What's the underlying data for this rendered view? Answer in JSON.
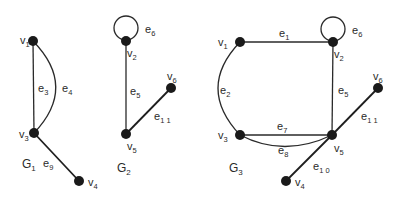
{
  "diagram": {
    "colors": {
      "background": "#ffffff",
      "ink": "#1a1a1a"
    },
    "graphs": [
      {
        "name": "G",
        "sub": "1",
        "label_pos": [
          22,
          168
        ],
        "nodes": [
          {
            "id": "v1",
            "name": "v",
            "sub": "1",
            "x": 33,
            "y": 41,
            "lx": 20,
            "ly": 44
          },
          {
            "id": "v3",
            "name": "v",
            "sub": "3",
            "x": 34,
            "y": 133,
            "lx": 19,
            "ly": 138
          },
          {
            "id": "v4",
            "name": "v",
            "sub": "4",
            "x": 79,
            "y": 181,
            "lx": 88,
            "ly": 186
          }
        ],
        "edges": [
          {
            "id": "e3",
            "name": "e",
            "sub": "3",
            "from": "v1",
            "to": "v3",
            "type": "line",
            "lx": 38,
            "ly": 92
          },
          {
            "id": "e4",
            "name": "e",
            "sub": "4",
            "from": "v1",
            "to": "v3",
            "type": "arc",
            "ctrl": [
              78,
              87
            ],
            "lx": 62,
            "ly": 92
          },
          {
            "id": "e9",
            "name": "e",
            "sub": "9",
            "from": "v3",
            "to": "v4",
            "type": "line",
            "lx": 43,
            "ly": 167
          }
        ]
      },
      {
        "name": "G",
        "sub": "2",
        "label_pos": [
          117,
          172
        ],
        "nodes": [
          {
            "id": "v2",
            "name": "v",
            "sub": "2",
            "x": 126,
            "y": 41,
            "lx": 127,
            "ly": 57
          },
          {
            "id": "v6",
            "name": "v",
            "sub": "6",
            "x": 171,
            "y": 88,
            "lx": 167,
            "ly": 80
          },
          {
            "id": "v5",
            "name": "v",
            "sub": "5",
            "x": 126,
            "y": 134,
            "lx": 127,
            "ly": 150
          }
        ],
        "edges": [
          {
            "id": "e6",
            "name": "e",
            "sub": "6",
            "from": "v2",
            "to": "v2",
            "type": "loop",
            "cx": 126,
            "cy": 28,
            "r": 12,
            "lx": 145,
            "ly": 33
          },
          {
            "id": "e5",
            "name": "e",
            "sub": "5",
            "from": "v2",
            "to": "v5",
            "type": "line",
            "lx": 130,
            "ly": 95
          },
          {
            "id": "e11",
            "name": "e",
            "sub": "1 1",
            "from": "v5",
            "to": "v6",
            "type": "line",
            "lx": 154,
            "ly": 120
          }
        ]
      },
      {
        "name": "G",
        "sub": "3",
        "label_pos": [
          229,
          172
        ],
        "nodes": [
          {
            "id": "v1",
            "name": "v",
            "sub": "1",
            "x": 240,
            "y": 42,
            "lx": 218,
            "ly": 46
          },
          {
            "id": "v2",
            "name": "v",
            "sub": "2",
            "x": 333,
            "y": 42,
            "lx": 334,
            "ly": 58
          },
          {
            "id": "v6",
            "name": "v",
            "sub": "6",
            "x": 378,
            "y": 88,
            "lx": 373,
            "ly": 80
          },
          {
            "id": "v3",
            "name": "v",
            "sub": "3",
            "x": 240,
            "y": 135,
            "lx": 218,
            "ly": 139
          },
          {
            "id": "v5",
            "name": "v",
            "sub": "5",
            "x": 332,
            "y": 135,
            "lx": 334,
            "ly": 152
          },
          {
            "id": "v4",
            "name": "v",
            "sub": "4",
            "x": 286,
            "y": 181,
            "lx": 295,
            "ly": 186
          }
        ],
        "edges": [
          {
            "id": "e1",
            "name": "e",
            "sub": "1",
            "from": "v1",
            "to": "v2",
            "type": "line",
            "lx": 279,
            "ly": 37
          },
          {
            "id": "e6",
            "name": "e",
            "sub": "6",
            "from": "v2",
            "to": "v2",
            "type": "loop",
            "cx": 333,
            "cy": 29,
            "r": 12,
            "lx": 352,
            "ly": 34
          },
          {
            "id": "e2",
            "name": "e",
            "sub": "2",
            "from": "v1",
            "to": "v3",
            "type": "arc",
            "ctrl": [
              196,
              88
            ],
            "lx": 220,
            "ly": 94
          },
          {
            "id": "e5",
            "name": "e",
            "sub": "5",
            "from": "v2",
            "to": "v5",
            "type": "line",
            "lx": 338,
            "ly": 94
          },
          {
            "id": "e7",
            "name": "e",
            "sub": "7",
            "from": "v3",
            "to": "v5",
            "type": "line",
            "lx": 277,
            "ly": 130
          },
          {
            "id": "e8",
            "name": "e",
            "sub": "8",
            "from": "v3",
            "to": "v5",
            "type": "arc",
            "ctrl": [
              284,
              158
            ],
            "lx": 278,
            "ly": 154
          },
          {
            "id": "e11",
            "name": "e",
            "sub": "1 1",
            "from": "v5",
            "to": "v6",
            "type": "line",
            "lx": 361,
            "ly": 120
          },
          {
            "id": "e10",
            "name": "e",
            "sub": "1 0",
            "from": "v5",
            "to": "v4",
            "type": "line",
            "lx": 313,
            "ly": 170
          }
        ]
      }
    ]
  }
}
